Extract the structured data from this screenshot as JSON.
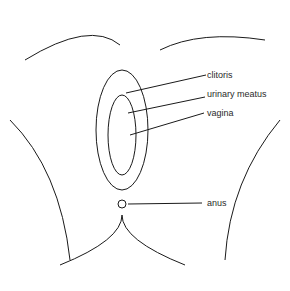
{
  "diagram": {
    "type": "labeled anatomical line illustration",
    "style": "black-and-white pen drawing",
    "labels": [
      {
        "text": "clitoris",
        "x": 207,
        "y": 70,
        "line_from": [
          206,
          75
        ],
        "line_to": [
          126,
          93
        ]
      },
      {
        "text": "urinary meatus",
        "x": 207,
        "y": 89,
        "line_from": [
          205,
          97
        ],
        "line_to": [
          128,
          113
        ]
      },
      {
        "text": "vagina",
        "x": 207,
        "y": 108,
        "line_from": [
          204,
          113
        ],
        "line_to": [
          130,
          135
        ]
      },
      {
        "text": "anus",
        "x": 207,
        "y": 198,
        "line_from": [
          202,
          203
        ],
        "line_to": [
          128,
          204
        ]
      }
    ],
    "colors": {
      "line": "#1a1a1a",
      "text": "#2a2a2a",
      "background": "#ffffff"
    }
  }
}
